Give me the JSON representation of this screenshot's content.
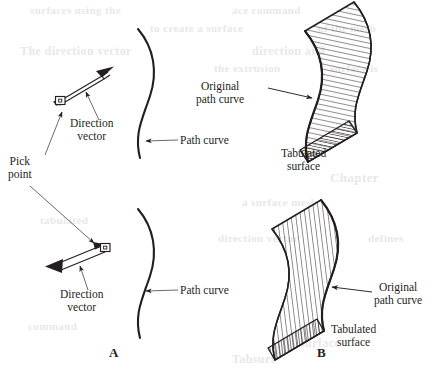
{
  "figure": {
    "background_color": "#ffffff",
    "ink_color": "#231f20",
    "bleed_color": "#e8e8ea",
    "panels": [
      {
        "id": "A",
        "letter": "A",
        "description": "Pick point and direction vector defining extrusion of a path curve"
      },
      {
        "id": "B",
        "letter": "B",
        "description": "Resulting tabulated surface swept from the original path curve"
      }
    ]
  },
  "labels": {
    "direction_vector_top": {
      "line1": "Direction",
      "line2": "vector"
    },
    "pick_point_top": {
      "line1": "Pick",
      "line2": "point"
    },
    "path_curve_top": {
      "text": "Path curve"
    },
    "original_path_curve_top": {
      "line1": "Original",
      "line2": "path curve"
    },
    "tabulated_surface_top": {
      "line1": "Tabulated",
      "line2": "surface"
    },
    "direction_vector_bottom": {
      "line1": "Direction",
      "line2": "vector"
    },
    "pick_point_bottom": {
      "line1": "Pick",
      "line2": "point"
    },
    "path_curve_bottom": {
      "text": "Path curve"
    },
    "original_path_curve_bottom": {
      "line1": "Original",
      "line2": "path curve"
    },
    "tabulated_surface_bottom": {
      "line1": "Tabulated",
      "line2": "surface"
    }
  },
  "bleed_text": [
    {
      "text": "surfaces using the",
      "x": 30,
      "y": 4,
      "size": 11
    },
    {
      "text": "ace command",
      "x": 232,
      "y": 4,
      "size": 11
    },
    {
      "text": "to create a surface",
      "x": 150,
      "y": 22,
      "size": 11
    },
    {
      "text": "of the mesh",
      "x": 318,
      "y": 22,
      "size": 11
    },
    {
      "text": "The direction vector",
      "x": 20,
      "y": 44,
      "size": 12
    },
    {
      "text": "direction and",
      "x": 252,
      "y": 44,
      "size": 12
    },
    {
      "text": "the extrusion",
      "x": 214,
      "y": 62,
      "size": 11
    },
    {
      "text": "surface is",
      "x": 330,
      "y": 62,
      "size": 11
    },
    {
      "text": "Chapter",
      "x": 330,
      "y": 170,
      "size": 13
    },
    {
      "text": "a surface mesh",
      "x": 242,
      "y": 196,
      "size": 11
    },
    {
      "text": "tabulated",
      "x": 40,
      "y": 214,
      "size": 11
    },
    {
      "text": "direction vector",
      "x": 218,
      "y": 232,
      "size": 11
    },
    {
      "text": "defines",
      "x": 368,
      "y": 232,
      "size": 11
    },
    {
      "text": "command",
      "x": 28,
      "y": 320,
      "size": 11
    },
    {
      "text": "surface",
      "x": 300,
      "y": 336,
      "size": 12
    },
    {
      "text": "Tabsurf",
      "x": 232,
      "y": 352,
      "size": 12
    }
  ]
}
